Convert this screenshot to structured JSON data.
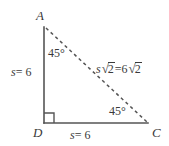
{
  "figure": {
    "type": "geometry-diagram",
    "shape": "right-isosceles-triangle",
    "background_color": "#ffffff",
    "line_color": "#555555",
    "text_color": "#3a3a3a",
    "vertices": [
      {
        "id": "A",
        "label": "A",
        "x": 44,
        "y": 27,
        "label_x": 36,
        "label_y": 9
      },
      {
        "id": "D",
        "label": "D",
        "x": 44,
        "y": 123,
        "label_x": 33,
        "label_y": 126
      },
      {
        "id": "C",
        "label": "C",
        "x": 148,
        "y": 123,
        "label_x": 152,
        "label_y": 126
      }
    ],
    "edges": [
      {
        "id": "AD",
        "from": "A",
        "to": "D",
        "style": "solid",
        "label": "s = 6"
      },
      {
        "id": "DC",
        "from": "D",
        "to": "C",
        "style": "solid",
        "label": "s = 6"
      },
      {
        "id": "AC",
        "from": "A",
        "to": "C",
        "style": "dashed",
        "label": "s √2 = 6 √2"
      }
    ],
    "angles": [
      {
        "at": "A",
        "label": "45°"
      },
      {
        "at": "D",
        "label": "",
        "marker": "right-angle-square"
      },
      {
        "at": "C",
        "label": "45°"
      }
    ],
    "labels": {
      "vertex_a": "A",
      "vertex_d": "D",
      "vertex_c": "C",
      "angle_a": "45°",
      "angle_c": "45°",
      "side_ad_var": "s",
      "side_ad_eq": "= 6",
      "side_dc_var": "s",
      "side_dc_eq": "= 6",
      "hyp_var": "s",
      "radical_symbol": "√",
      "radicand_left": "2",
      "hyp_equals": "=",
      "hyp_coefficient": "6",
      "radicand_right": "2"
    }
  }
}
